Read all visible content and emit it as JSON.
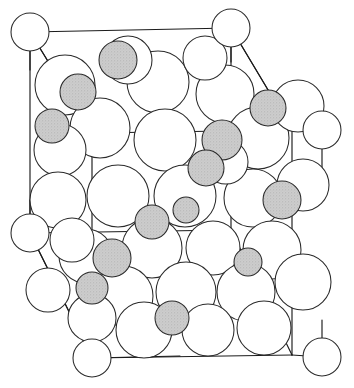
{
  "figure": {
    "kind": "line-drawing",
    "background_color": "#ffffff",
    "line_color": "#1b1b1b",
    "large_atom_fill": "#ffffff",
    "large_atom_stroke": "#2a2a2a",
    "small_atom_fill": "#c9c9c9",
    "small_atom_stroke": "#2a2a2a",
    "width": 354,
    "height": 388
  },
  "unit_cell": {
    "name": "unit-cell-wireframe",
    "corners": {
      "front_top_left": [
        92,
        133
      ],
      "front_top_right": [
        292,
        130
      ],
      "front_bottom_left": [
        92,
        358
      ],
      "front_bottom_right": [
        292,
        355
      ],
      "back_top_left": [
        30,
        32
      ],
      "back_top_right": [
        231,
        28
      ],
      "back_bottom_left": [
        30,
        233
      ],
      "back_bottom_right": [
        231,
        230
      ]
    },
    "edges": [
      [
        30,
        32,
        231,
        28
      ],
      [
        30,
        32,
        30,
        233
      ],
      [
        231,
        28,
        231,
        230
      ],
      [
        30,
        233,
        231,
        230
      ],
      [
        92,
        133,
        292,
        130
      ],
      [
        92,
        133,
        92,
        358
      ],
      [
        292,
        130,
        292,
        355
      ],
      [
        92,
        358,
        292,
        355
      ],
      [
        30,
        32,
        92,
        133
      ],
      [
        231,
        28,
        292,
        130
      ],
      [
        30,
        233,
        92,
        358
      ],
      [
        231,
        230,
        292,
        355
      ]
    ],
    "corner_markers": [
      {
        "cx": 30,
        "cy": 32,
        "r": 19,
        "label": "corner-back-top-left"
      },
      {
        "cx": 231,
        "cy": 28,
        "r": 19,
        "label": "corner-back-top-right"
      },
      {
        "cx": 322,
        "cy": 130,
        "r": 19,
        "label": "corner-front-top-right"
      },
      {
        "cx": 30,
        "cy": 233,
        "r": 19,
        "label": "corner-back-bottom-left"
      },
      {
        "cx": 92,
        "cy": 358,
        "r": 19,
        "label": "corner-front-bottom-left"
      },
      {
        "cx": 322,
        "cy": 357,
        "r": 19,
        "label": "corner-front-bottom-right"
      }
    ],
    "corner_stems": [
      [
        30,
        32,
        30,
        70
      ],
      [
        30,
        32,
        92,
        133
      ],
      [
        231,
        28,
        231,
        62
      ],
      [
        231,
        28,
        292,
        130
      ],
      [
        322,
        130,
        292,
        130
      ],
      [
        322,
        130,
        322,
        168
      ],
      [
        30,
        233,
        30,
        200
      ],
      [
        30,
        233,
        92,
        358
      ],
      [
        92,
        358,
        92,
        320
      ],
      [
        92,
        358,
        180,
        356
      ],
      [
        322,
        357,
        292,
        355
      ],
      [
        322,
        357,
        322,
        320
      ]
    ]
  },
  "atoms": {
    "large_radius_nominal": 30,
    "small_radius_nominal": 18,
    "large": [
      {
        "cx": 65,
        "cy": 85,
        "r": 30
      },
      {
        "cx": 158,
        "cy": 82,
        "r": 31
      },
      {
        "cx": 225,
        "cy": 94,
        "r": 29
      },
      {
        "cx": 100,
        "cy": 128,
        "r": 30
      },
      {
        "cx": 165,
        "cy": 140,
        "r": 31
      },
      {
        "cx": 60,
        "cy": 150,
        "r": 26
      },
      {
        "cx": 258,
        "cy": 138,
        "r": 31
      },
      {
        "cx": 298,
        "cy": 106,
        "r": 26
      },
      {
        "cx": 58,
        "cy": 200,
        "r": 28
      },
      {
        "cx": 118,
        "cy": 196,
        "r": 31
      },
      {
        "cx": 185,
        "cy": 196,
        "r": 31
      },
      {
        "cx": 253,
        "cy": 198,
        "r": 29
      },
      {
        "cx": 303,
        "cy": 185,
        "r": 26
      },
      {
        "cx": 152,
        "cy": 248,
        "r": 30
      },
      {
        "cx": 213,
        "cy": 248,
        "r": 27
      },
      {
        "cx": 272,
        "cy": 250,
        "r": 29
      },
      {
        "cx": 86,
        "cy": 256,
        "r": 27
      },
      {
        "cx": 123,
        "cy": 296,
        "r": 30
      },
      {
        "cx": 186,
        "cy": 292,
        "r": 30
      },
      {
        "cx": 246,
        "cy": 292,
        "r": 29
      },
      {
        "cx": 303,
        "cy": 282,
        "r": 28
      },
      {
        "cx": 144,
        "cy": 330,
        "r": 28
      },
      {
        "cx": 208,
        "cy": 330,
        "r": 26
      },
      {
        "cx": 264,
        "cy": 328,
        "r": 27
      },
      {
        "cx": 92,
        "cy": 318,
        "r": 24
      },
      {
        "cx": 205,
        "cy": 58,
        "r": 22
      },
      {
        "cx": 128,
        "cy": 60,
        "r": 24
      },
      {
        "cx": 72,
        "cy": 240,
        "r": 22
      },
      {
        "cx": 48,
        "cy": 290,
        "r": 22
      },
      {
        "cx": 226,
        "cy": 162,
        "r": 22
      }
    ],
    "small": [
      {
        "cx": 118,
        "cy": 60,
        "r": 19
      },
      {
        "cx": 78,
        "cy": 92,
        "r": 18
      },
      {
        "cx": 52,
        "cy": 126,
        "r": 17
      },
      {
        "cx": 268,
        "cy": 108,
        "r": 18
      },
      {
        "cx": 222,
        "cy": 140,
        "r": 20
      },
      {
        "cx": 206,
        "cy": 168,
        "r": 18
      },
      {
        "cx": 282,
        "cy": 200,
        "r": 19
      },
      {
        "cx": 186,
        "cy": 210,
        "r": 13
      },
      {
        "cx": 152,
        "cy": 222,
        "r": 17
      },
      {
        "cx": 112,
        "cy": 258,
        "r": 19
      },
      {
        "cx": 92,
        "cy": 288,
        "r": 16
      },
      {
        "cx": 248,
        "cy": 262,
        "r": 14
      },
      {
        "cx": 172,
        "cy": 318,
        "r": 17
      }
    ]
  }
}
